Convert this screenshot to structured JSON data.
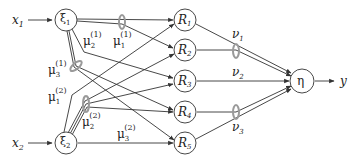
{
  "diagram": {
    "type": "fuzzy-neural-network",
    "colors": {
      "line": "#333333",
      "node_stroke": "#333333",
      "node_fill": "#ffffff",
      "weight_ellipse": "#9a9a9a",
      "text": "#222222"
    },
    "inputs": [
      {
        "id": "x1",
        "label": "x",
        "sub": "1"
      },
      {
        "id": "x2",
        "label": "x",
        "sub": "2"
      }
    ],
    "fuzzifiers": [
      {
        "id": "xi1",
        "label": "ξ",
        "sub": "1"
      },
      {
        "id": "xi2",
        "label": "ξ",
        "sub": "2"
      }
    ],
    "rules": [
      {
        "id": "R1",
        "label": "R",
        "sub": "1"
      },
      {
        "id": "R2",
        "label": "R",
        "sub": "2"
      },
      {
        "id": "R3",
        "label": "R",
        "sub": "3"
      },
      {
        "id": "R4",
        "label": "R",
        "sub": "4"
      },
      {
        "id": "R5",
        "label": "R",
        "sub": "5"
      }
    ],
    "output_node": {
      "id": "eta",
      "label": "η"
    },
    "output": {
      "id": "y",
      "label": "y"
    },
    "membership_labels": [
      {
        "id": "mu1_1",
        "label": "μ",
        "sub": "1",
        "sup": "(1)"
      },
      {
        "id": "mu2_1",
        "label": "μ",
        "sub": "2",
        "sup": "(1)"
      },
      {
        "id": "mu3_1",
        "label": "μ",
        "sub": "3",
        "sup": "(1)"
      },
      {
        "id": "mu1_2",
        "label": "μ",
        "sub": "1",
        "sup": "(2)"
      },
      {
        "id": "mu2_2",
        "label": "μ",
        "sub": "2",
        "sup": "(2)"
      },
      {
        "id": "mu3_2",
        "label": "μ",
        "sub": "3",
        "sup": "(2)"
      }
    ],
    "consequent_labels": [
      {
        "id": "v1",
        "label": "ν",
        "sub": "1"
      },
      {
        "id": "v2",
        "label": "ν",
        "sub": "2"
      },
      {
        "id": "v3",
        "label": "ν",
        "sub": "3"
      }
    ]
  }
}
